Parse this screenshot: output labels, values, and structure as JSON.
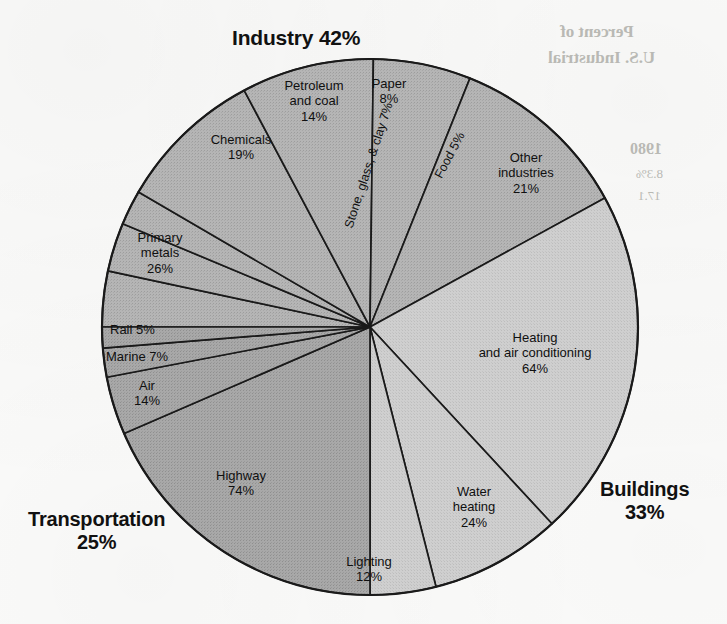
{
  "chart_data": {
    "type": "pie",
    "title": "",
    "units": "percent",
    "groups": [
      {
        "name": "Industry",
        "value": 42,
        "label": "Industry 42%",
        "color": "#b3b3b3",
        "slices": [
          {
            "name": "Paper",
            "value": 8,
            "label": "Paper",
            "value_label": "8%"
          },
          {
            "name": "Stone, glass, & clay",
            "value": 7,
            "label": "Stone, glass, & clay",
            "value_label": "7%",
            "combined_label": "Stone, glass, & clay 7%"
          },
          {
            "name": "Food",
            "value": 5,
            "label": "Food",
            "value_label": "5%",
            "combined_label": "Food 5%"
          },
          {
            "name": "Other industries",
            "value": 21,
            "label": "Other industries",
            "value_label": "21%"
          },
          {
            "name": "Chemicals",
            "value": 19,
            "label": "Chemicals",
            "value_label": "19%"
          },
          {
            "name": "Petroleum and coal",
            "value": 14,
            "label": "Petroleum and coal",
            "value_label": "14%"
          },
          {
            "name": "Primary metals",
            "value": 26,
            "label": "Primary metals",
            "value_label": "26%"
          }
        ]
      },
      {
        "name": "Buildings",
        "value": 33,
        "label": "Buildings 33%",
        "color": "#c9c9c9",
        "slices": [
          {
            "name": "Heating and air conditioning",
            "value": 64,
            "label": "Heating and air conditioning",
            "value_label": "64%"
          },
          {
            "name": "Water heating",
            "value": 24,
            "label": "Water heating",
            "value_label": "24%"
          },
          {
            "name": "Lighting",
            "value": 12,
            "label": "Lighting",
            "value_label": "12%"
          }
        ]
      },
      {
        "name": "Transportation",
        "value": 25,
        "label": "Transportation 25%",
        "color": "#a6a6a6",
        "slices": [
          {
            "name": "Highway",
            "value": 74,
            "label": "Highway",
            "value_label": "74%"
          },
          {
            "name": "Air",
            "value": 14,
            "label": "Air",
            "value_label": "14%"
          },
          {
            "name": "Marine",
            "value": 7,
            "label": "Marine",
            "value_label": "7%",
            "combined_label": "Marine 7%"
          },
          {
            "name": "Rail",
            "value": 5,
            "label": "Rail",
            "value_label": "5%",
            "combined_label": "Rail 5%"
          }
        ]
      }
    ]
  },
  "headings": {
    "industry": "Industry 42%",
    "buildings_line1": "Buildings",
    "buildings_line2": "33%",
    "transportation_line1": "Transportation",
    "transportation_line2": "25%"
  },
  "labels": {
    "paper": "Paper\n8%",
    "stone_glass_clay": "Stone, glass, & clay 7%",
    "food": "Food 5%",
    "other_industries": "Other\nindustries\n21%",
    "chemicals": "Chemicals\n19%",
    "petroleum_and_coal": "Petroleum\nand coal\n14%",
    "primary_metals": "Primary\nmetals\n26%",
    "heating_air": "Heating\nand air conditioning\n64%",
    "water_heating": "Water\nheating\n24%",
    "lighting": "Lighting\n12%",
    "highway": "Highway\n74%",
    "air": "Air\n14%",
    "marine": "Marine 7%",
    "rail": "Rail 5%"
  },
  "ghost_text": {
    "g1": "Percent of",
    "g2": "U.S. Industrial",
    "g3": "1980",
    "g4": "8.3%",
    "g5": "17.1"
  },
  "colors": {
    "industry": "#b3b3b3",
    "buildings": "#c9c9c9",
    "transportation": "#a6a6a6",
    "outline": "#1a1a1a",
    "text": "#101010",
    "background": "#fdfdfc"
  }
}
